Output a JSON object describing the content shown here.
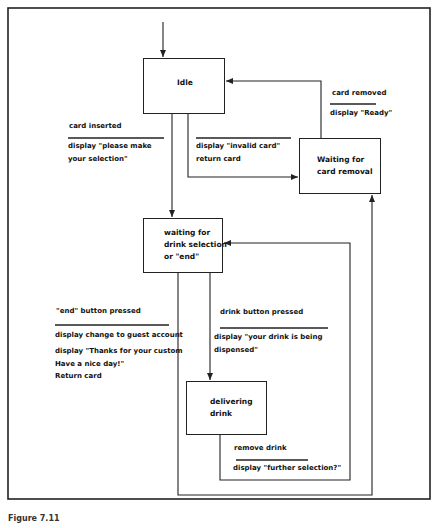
{
  "diagram": {
    "type": "state-transition-diagram",
    "states": [
      {
        "id": "idle",
        "label": "Idle"
      },
      {
        "id": "waiting_card_removal",
        "label": "Waiting for\ncard removal"
      },
      {
        "id": "waiting_drink",
        "label": "waiting for\ndrink selection\nor \"end\""
      },
      {
        "id": "delivering",
        "label": "delivering\ndrink"
      }
    ],
    "transitions": [
      {
        "id": "card_inserted",
        "from": "idle",
        "to": "waiting_drink",
        "event": "card inserted",
        "action": "display \"please make\nyour selection\""
      },
      {
        "id": "invalid_card",
        "from": "idle",
        "to": "waiting_card_removal",
        "event": "",
        "action": "display \"invalid card\"\nreturn card"
      },
      {
        "id": "card_removed",
        "from": "waiting_card_removal",
        "to": "idle",
        "event": "card removed",
        "action": "display \"Ready\""
      },
      {
        "id": "end_pressed",
        "from": "waiting_drink",
        "to": "waiting_card_removal",
        "event": "\"end\" button pressed",
        "action": "display change to guest account",
        "action2": "display \"Thanks for your custom\nHave a nice day!\"\nReturn card"
      },
      {
        "id": "drink_pressed",
        "from": "waiting_drink",
        "to": "delivering",
        "event": "drink button pressed",
        "action": "display \"your drink is being\ndispensed\""
      },
      {
        "id": "remove_drink",
        "from": "delivering",
        "to": "waiting_drink",
        "event": "remove drink",
        "action": "display \"further selection?\""
      }
    ],
    "caption": "Figure 7.11"
  },
  "colors": {
    "line": "#222222",
    "background": "#ffffff",
    "text": "#111111"
  }
}
